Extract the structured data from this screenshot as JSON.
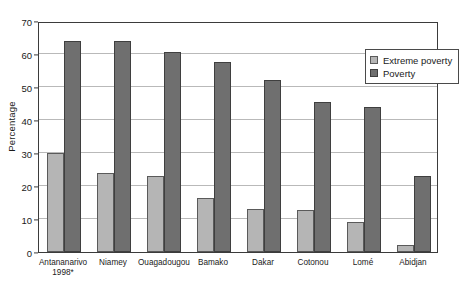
{
  "chart_data": {
    "type": "bar",
    "title": "",
    "xlabel": "",
    "ylabel": "Percentage",
    "ylim": [
      0,
      70
    ],
    "yticks": [
      0,
      10,
      20,
      30,
      40,
      50,
      60,
      70
    ],
    "grid": true,
    "legend_position": "top-right",
    "categories": [
      "Antananarivo\n1998*",
      "Niamey",
      "Ouagadougou",
      "Bamako",
      "Dakar",
      "Cotonou",
      "Lomé",
      "Abidjan"
    ],
    "series": [
      {
        "name": "Extreme poverty",
        "color": "#b5b5b5",
        "values": [
          30,
          24,
          23,
          16.5,
          13,
          12.8,
          9,
          2
        ]
      },
      {
        "name": "Poverty",
        "color": "#6f6f6f",
        "values": [
          64,
          64,
          60.5,
          57.5,
          52,
          45.5,
          44,
          23
        ]
      }
    ]
  },
  "legend": {
    "items": [
      {
        "label": "Extreme poverty"
      },
      {
        "label": "Poverty"
      }
    ]
  }
}
